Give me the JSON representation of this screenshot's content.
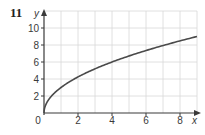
{
  "question_number": "11",
  "chart_data": {
    "type": "line",
    "title": "",
    "xlabel": "x",
    "ylabel": "y",
    "xlim": [
      0,
      9
    ],
    "ylim": [
      0,
      12
    ],
    "grid": true,
    "x_ticks": [
      "0",
      "2",
      "4",
      "6",
      "8"
    ],
    "y_ticks": [
      "2",
      "4",
      "6",
      "8",
      "10"
    ],
    "series": [
      {
        "name": "y = 3√x",
        "x": [
          0,
          0.25,
          0.5,
          1,
          2,
          3,
          4,
          5,
          6,
          7,
          8,
          9
        ],
        "values": [
          0,
          1.5,
          2.12,
          3,
          4.24,
          5.2,
          6,
          6.71,
          7.35,
          7.94,
          8.49,
          9
        ]
      }
    ],
    "colors": {
      "curve": "#4a4a4a",
      "axis": "#3a3a3a",
      "grid": "#d8d8d8"
    }
  }
}
